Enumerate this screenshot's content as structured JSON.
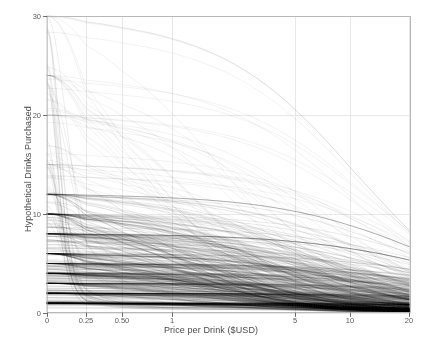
{
  "chart_data": {
    "type": "line",
    "title": "",
    "subtitle": "",
    "xlabel": "Price per Drink ($USD)",
    "ylabel": "Hypothetical Drinks Purchased",
    "x_scale": "log-like (pseudo-log, includes zero)",
    "y_scale": "linear",
    "xlim": [
      0,
      20
    ],
    "ylim": [
      0,
      30
    ],
    "grid": true,
    "legend": null,
    "legend_position": "none",
    "series_count": 500,
    "series_description": "Individual hypothetical alcohol purchase-task demand curves, one semi-transparent black line per participant",
    "line_color": "#000000",
    "line_opacity": 0.17,
    "line_width": 0.55,
    "x_ticks": [
      {
        "label": "0",
        "value": 0
      },
      {
        "label": "0.25",
        "value": 0.25
      },
      {
        "label": "0.50",
        "value": 0.5
      },
      {
        "label": "1",
        "value": 1
      },
      {
        "label": "5",
        "value": 5
      },
      {
        "label": "10",
        "value": 10
      },
      {
        "label": "20",
        "value": 20
      }
    ],
    "y_ticks": [
      {
        "label": "0",
        "value": 0
      },
      {
        "label": "10",
        "value": 10
      },
      {
        "label": "20",
        "value": 20
      },
      {
        "label": "30",
        "value": 30
      }
    ],
    "x_tick_pixels": [
      47,
      86,
      122,
      172,
      295,
      350,
      409
    ],
    "model": "Hursh & Silberberg exponential demand: log10(Q) = log10(Q0) + k*(exp(-alpha*Q0*P) - 1)",
    "k": 1.45,
    "intercept_modes": [
      1,
      2,
      3,
      4,
      5,
      6,
      8,
      10,
      12,
      15,
      20,
      24,
      30
    ],
    "intercept_mode_weights": [
      0.135,
      0.125,
      0.105,
      0.095,
      0.09,
      0.075,
      0.075,
      0.085,
      0.055,
      0.04,
      0.035,
      0.02,
      0.015
    ],
    "alpha_range": [
      0.0015,
      0.09
    ]
  },
  "axes": {
    "x_title": "Price per Drink ($USD)",
    "y_title": "Hypothetical Drinks Purchased"
  },
  "style": {
    "background": "#ffffff",
    "border_color": "#b8b8b8",
    "grid_color": "#e8e8e8",
    "tick_color": "#6a6a6a",
    "label_color": "#4a4a4a"
  }
}
